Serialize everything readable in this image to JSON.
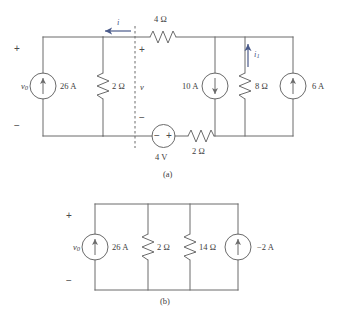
{
  "figure": {
    "background_color": "#ffffff",
    "wire_color": "#6b6b6b",
    "arrow_color": "#4a5a8a",
    "text_color": "#3d3d3d"
  },
  "circuit_a": {
    "caption": "(a)",
    "plus_sign": "+",
    "minus_sign": "−",
    "source_v0_label": "v",
    "source_v0_sub": "0",
    "current_source_26a": "26 A",
    "resistor_2ohm_left": "2 Ω",
    "branch_voltage_label": "v",
    "branch_plus": "+",
    "branch_minus": "−",
    "mesh_current_label": "i",
    "resistor_4ohm_top": "4 Ω",
    "current_source_10a": "10 A",
    "resistor_8ohm": "8 Ω",
    "current_i1_label": "i",
    "current_i1_sub": "1",
    "current_source_6a": "6 A",
    "voltage_source_4v": "4 V",
    "source_4v_minus": "−",
    "source_4v_plus": "+",
    "resistor_2ohm_bottom": "2 Ω"
  },
  "circuit_b": {
    "caption": "(b)",
    "plus_sign": "+",
    "minus_sign": "−",
    "source_v0_label": "v",
    "source_v0_sub": "0",
    "current_source_26a": "26 A",
    "resistor_2ohm": "2 Ω",
    "resistor_14ohm": "14 Ω",
    "current_source_neg2a": "−2 A"
  }
}
